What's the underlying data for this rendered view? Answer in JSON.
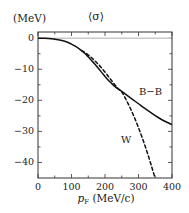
{
  "figure": {
    "unit_label": "(MeV)",
    "title": "⟨σ⟩"
  },
  "chart_data": {
    "type": "line",
    "title": "⟨σ⟩",
    "unit_label": "(MeV)",
    "xlabel_main": "p",
    "xlabel_sub": "F",
    "xlabel_unit": "(MeV/c)",
    "xlabel": "p_F (MeV/c)",
    "ylabel": "⟨σ⟩ (MeV)",
    "xlim": [
      0,
      400
    ],
    "ylim": [
      -45,
      2
    ],
    "xticks": [
      0,
      100,
      200,
      300,
      400
    ],
    "xtick_labels": [
      "0",
      "100",
      "200",
      "300",
      "400"
    ],
    "xticks_minor": [
      50,
      150,
      250,
      350
    ],
    "yticks": [
      0,
      -10,
      -20,
      -30,
      -40
    ],
    "ytick_labels": [
      "0",
      "−10",
      "−20",
      "−30",
      "−40"
    ],
    "yticks_minor": [
      -5,
      -15,
      -25,
      -35,
      -45
    ],
    "grid": false,
    "legend_position": "inline-annotations",
    "zero_line": true,
    "series": [
      {
        "name": "B−B",
        "label": "B−B",
        "style": "solid",
        "color": "#111111",
        "annotation_xy": [
          305,
          -16
        ],
        "x": [
          0,
          20,
          40,
          60,
          80,
          100,
          110,
          120,
          130,
          140,
          150,
          160,
          170,
          180,
          190,
          200,
          210,
          220,
          230,
          240,
          250,
          260,
          270,
          280,
          290,
          300,
          320,
          340,
          360,
          380,
          400
        ],
        "y": [
          0.0,
          -0.05,
          -0.2,
          -0.5,
          -1.0,
          -1.9,
          -2.5,
          -3.2,
          -4.0,
          -4.9,
          -6.0,
          -7.2,
          -8.4,
          -9.7,
          -11.0,
          -12.3,
          -13.5,
          -14.6,
          -15.6,
          -16.4,
          -17.1,
          -17.9,
          -18.7,
          -19.5,
          -20.3,
          -21.1,
          -22.7,
          -24.2,
          -25.6,
          -26.8,
          -27.8
        ]
      },
      {
        "name": "W",
        "label": "W",
        "style": "dashed",
        "color": "#111111",
        "annotation_xy": [
          248,
          -33
        ],
        "x": [
          130,
          140,
          150,
          160,
          170,
          180,
          190,
          200,
          210,
          220,
          230,
          240,
          250,
          260,
          270,
          280,
          290,
          300,
          310,
          320,
          330,
          340,
          348
        ],
        "y": [
          -4.0,
          -4.6,
          -5.4,
          -6.3,
          -7.3,
          -8.4,
          -9.6,
          -10.9,
          -12.3,
          -13.7,
          -15.1,
          -16.3,
          -17.3,
          -19.2,
          -21.3,
          -23.6,
          -26.1,
          -28.8,
          -31.7,
          -34.8,
          -38.1,
          -41.6,
          -44.5
        ]
      }
    ]
  }
}
